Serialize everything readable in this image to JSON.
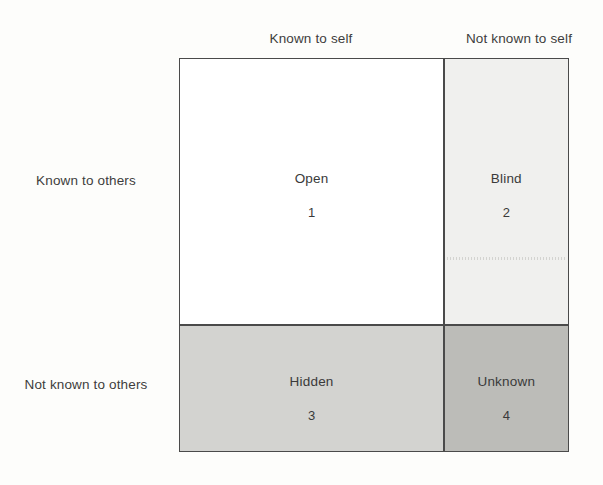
{
  "diagram": {
    "column_headers": [
      {
        "id": "known-to-self",
        "label": "Known to self"
      },
      {
        "id": "not-known-to-self",
        "label": "Not known to self"
      }
    ],
    "row_headers": [
      {
        "id": "known-to-others",
        "label": "Known to others"
      },
      {
        "id": "not-known-to-others",
        "label": "Not known to others"
      }
    ],
    "quadrants": [
      {
        "id": "open",
        "title": "Open",
        "number": "1",
        "fill": "#ffffff"
      },
      {
        "id": "blind",
        "title": "Blind",
        "number": "2",
        "fill": "#f0f0ee"
      },
      {
        "id": "hidden",
        "title": "Hidden",
        "number": "3",
        "fill": "#d3d3d0"
      },
      {
        "id": "unknown",
        "title": "Unknown",
        "number": "4",
        "fill": "#bcbcb8"
      }
    ],
    "border_color": "#4a4a4a",
    "text_color": "#3a3a3a",
    "background_color": "#fdfdfb"
  }
}
